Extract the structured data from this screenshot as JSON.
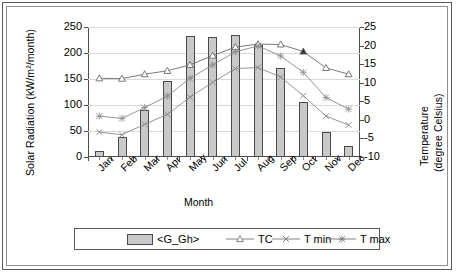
{
  "chart_data": {
    "type": "bar",
    "title": "",
    "subtitle": "",
    "xlabel": "Month",
    "ylabel": "Solar Radiation (kW/m²/month)",
    "ylabel_right_line1": "Temperature",
    "ylabel_right_line2": "(degree Celsius)",
    "categories": [
      "Jan",
      "Feb",
      "Mar",
      "Apr",
      "May",
      "Jun",
      "Jul",
      "Aug",
      "Sep",
      "Oct",
      "Nov",
      "Dec"
    ],
    "ylim": [
      0,
      250
    ],
    "yticks": [
      0,
      50,
      100,
      150,
      200,
      250
    ],
    "ylim_right": [
      -10,
      25
    ],
    "yticks_right": [
      -10,
      -5,
      0,
      5,
      10,
      15,
      20,
      25
    ],
    "grid": true,
    "legend_position": "bottom",
    "series": [
      {
        "name": "<G_Gh>",
        "type": "bar",
        "axis": "left",
        "unit": "kW/m²/month",
        "color": "#c9c9c9",
        "edge_color": "#4a4a4a",
        "values": [
          11,
          39,
          90,
          146,
          232,
          231,
          235,
          216,
          172,
          106,
          49,
          21
        ]
      },
      {
        "name": "TC",
        "type": "line",
        "axis": "right",
        "unit": "degree Celsius",
        "marker": "triangle",
        "color": "#6b6b6b",
        "values": [
          11.2,
          11.1,
          12.3,
          13.2,
          14.8,
          17.3,
          19.6,
          20.4,
          20.3,
          18.4,
          14.0,
          12.3
        ]
      },
      {
        "name": "T min",
        "type": "line",
        "axis": "right",
        "unit": "degree Celsius",
        "marker": "x",
        "color": "#8a8a8a",
        "values": [
          -3.3,
          -4.0,
          -1.2,
          1.5,
          6.1,
          10.1,
          13.8,
          14.1,
          11.5,
          6.5,
          1.0,
          -1.4
        ]
      },
      {
        "name": "T max",
        "type": "line",
        "axis": "right",
        "unit": "degree Celsius",
        "marker": "asterisk",
        "color": "#8a8a8a",
        "values": [
          1.0,
          0.4,
          3.3,
          6.4,
          11.2,
          14.8,
          18.3,
          19.9,
          17.2,
          12.8,
          6.0,
          2.9
        ]
      }
    ]
  },
  "legend": {
    "items": [
      {
        "label": "<G_Gh>",
        "marker": "bar"
      },
      {
        "label": "TC",
        "marker": "triangle"
      },
      {
        "label": "T min",
        "marker": "x"
      },
      {
        "label": "T max",
        "marker": "asterisk"
      }
    ]
  }
}
